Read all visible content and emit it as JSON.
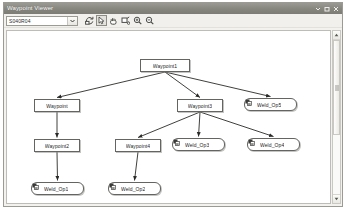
{
  "window": {
    "title": "Waypoint Viewer",
    "controls": [
      {
        "name": "minimize-button",
        "glyph": "▾"
      },
      {
        "name": "maximize-button",
        "glyph": "□"
      },
      {
        "name": "close-button",
        "glyph": "✕"
      }
    ]
  },
  "toolbar": {
    "combo": {
      "value": "S040R04",
      "placeholder": "S040R04",
      "arrow_glyph": "▼"
    },
    "buttons": [
      {
        "name": "refresh-tree-button",
        "icon": "refresh-icon",
        "pressed": false
      },
      {
        "name": "select-pointer-button",
        "icon": "pointer-icon",
        "pressed": true
      },
      {
        "name": "pan-hand-button",
        "icon": "pan-icon",
        "pressed": false
      },
      {
        "name": "fit-to-window-button",
        "icon": "fit-window-icon",
        "pressed": false
      },
      {
        "name": "zoom-in-button",
        "icon": "zoom-in-icon",
        "pressed": false
      },
      {
        "name": "zoom-out-button",
        "icon": "zoom-out-icon",
        "pressed": false
      }
    ]
  },
  "scrollbar": {
    "up_glyph": "▴",
    "down_glyph": "▾"
  },
  "graph": {
    "nodes": [
      {
        "id": "n1",
        "label": "Waypoint1",
        "shape": "rect",
        "icon": null,
        "x": 133,
        "y": 28,
        "w": 50,
        "h": 13
      },
      {
        "id": "n2",
        "label": "Waypoint",
        "shape": "rect",
        "icon": null,
        "x": 27,
        "y": 68,
        "w": 46,
        "h": 13
      },
      {
        "id": "n3",
        "label": "Waypoint3",
        "shape": "rect",
        "icon": null,
        "x": 170,
        "y": 68,
        "w": 46,
        "h": 13
      },
      {
        "id": "n4",
        "label": "Weld_Op5",
        "shape": "rounded",
        "icon": "weld-icon",
        "x": 237,
        "y": 67,
        "w": 53,
        "h": 13
      },
      {
        "id": "n5",
        "label": "Waypoint2",
        "shape": "rect",
        "icon": null,
        "x": 27,
        "y": 108,
        "w": 46,
        "h": 13
      },
      {
        "id": "n6",
        "label": "Waypoint4",
        "shape": "rect",
        "icon": null,
        "x": 108,
        "y": 108,
        "w": 46,
        "h": 13
      },
      {
        "id": "n7",
        "label": "Weld_Op3",
        "shape": "rounded",
        "icon": "weld-icon",
        "x": 165,
        "y": 107,
        "w": 53,
        "h": 13
      },
      {
        "id": "n8",
        "label": "Weld_Op4",
        "shape": "rounded",
        "icon": "weld-icon",
        "x": 240,
        "y": 107,
        "w": 53,
        "h": 13
      },
      {
        "id": "n9",
        "label": "Weld_Op1",
        "shape": "rounded",
        "icon": "weld-icon",
        "x": 24,
        "y": 151,
        "w": 53,
        "h": 13
      },
      {
        "id": "n10",
        "label": "Weld_Op2",
        "shape": "rounded",
        "icon": "weld-icon",
        "x": 101,
        "y": 151,
        "w": 53,
        "h": 13
      }
    ],
    "edges": [
      {
        "from": "n1",
        "to": "n2"
      },
      {
        "from": "n1",
        "to": "n3"
      },
      {
        "from": "n1",
        "to": "n4"
      },
      {
        "from": "n2",
        "to": "n5"
      },
      {
        "from": "n3",
        "to": "n6"
      },
      {
        "from": "n3",
        "to": "n7"
      },
      {
        "from": "n3",
        "to": "n8"
      },
      {
        "from": "n5",
        "to": "n9"
      },
      {
        "from": "n6",
        "to": "n10"
      }
    ]
  },
  "colors": {
    "titlebar": "#86867f",
    "node_border": "#646460",
    "canvas_bg": "#ffffff",
    "chrome": "#f1f0ec"
  }
}
